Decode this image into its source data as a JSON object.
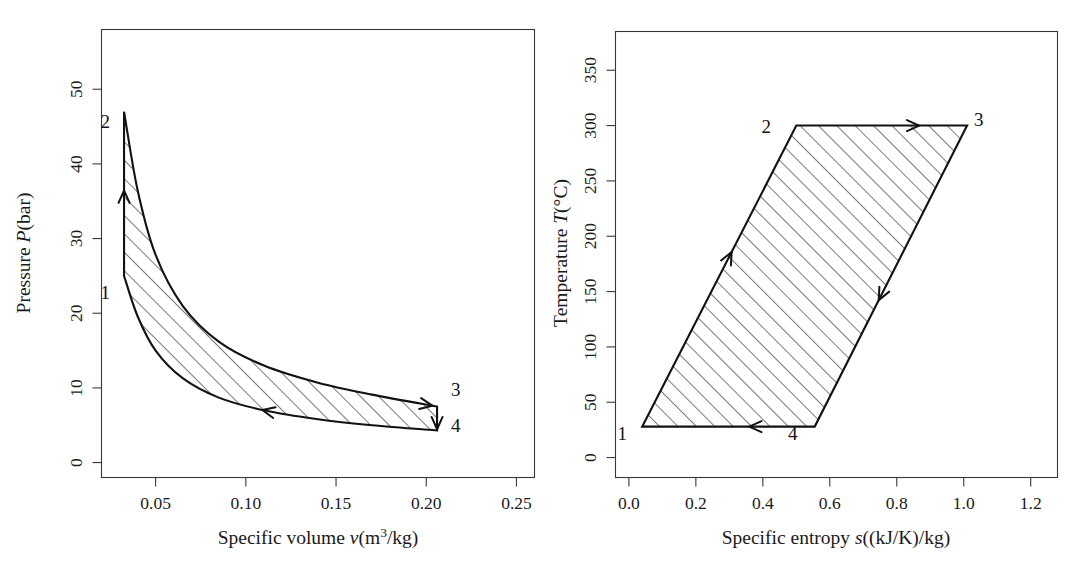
{
  "figure": {
    "panels": [
      {
        "id": "pv-diagram",
        "xlabel_prefix": "Specific volume ",
        "xlabel_symbol": "v",
        "xlabel_units": "(m",
        "xlabel_exp": "3",
        "xlabel_units_tail": "/kg)",
        "ylabel_prefix": "Pressure ",
        "ylabel_symbol": "P",
        "ylabel_units": "(bar)",
        "xticklabels": [
          "0.05",
          "0.10",
          "0.15",
          "0.20",
          "0.25"
        ],
        "yticklabels": [
          "0",
          "10",
          "20",
          "30",
          "40",
          "50"
        ],
        "statelabels": [
          "1",
          "2",
          "3",
          "4"
        ]
      },
      {
        "id": "ts-diagram",
        "xlabel_prefix": "Specific entropy ",
        "xlabel_symbol": "s",
        "xlabel_units": "((kJ/K)/kg)",
        "ylabel_prefix": "Temperature ",
        "ylabel_symbol": "T",
        "ylabel_units": "(°C)",
        "xticklabels": [
          "0.0",
          "0.2",
          "0.4",
          "0.6",
          "0.8",
          "1.0",
          "1.2"
        ],
        "yticklabels": [
          "0",
          "50",
          "100",
          "150",
          "200",
          "250",
          "300",
          "350"
        ],
        "statelabels": [
          "1",
          "2",
          "3",
          "4"
        ]
      }
    ]
  },
  "chart_data": [
    {
      "type": "line",
      "id": "pv-diagram",
      "title": "",
      "xlabel": "Specific volume v(m3/kg)",
      "ylabel": "Pressure P(bar)",
      "xlim": [
        0.02,
        0.26
      ],
      "ylim": [
        -2,
        58
      ],
      "xticks": [
        0.05,
        0.1,
        0.15,
        0.2,
        0.25
      ],
      "yticks": [
        0,
        10,
        20,
        30,
        40,
        50
      ],
      "grid": false,
      "legend": false,
      "annotations": [
        {
          "label": "1",
          "x": 0.0325,
          "y": 25.0
        },
        {
          "label": "2",
          "x": 0.0325,
          "y": 47.0
        },
        {
          "label": "3",
          "x": 0.206,
          "y": 7.5
        },
        {
          "label": "4",
          "x": 0.206,
          "y": 4.3
        }
      ],
      "series": [
        {
          "name": "1-2 isentropic compression",
          "direction": "upward",
          "points": [
            [
              0.0325,
              25.0
            ],
            [
              0.0325,
              47.0
            ]
          ]
        },
        {
          "name": "2-3 expansion (upper curve)",
          "direction": "rightward",
          "points": [
            [
              0.0325,
              47.0
            ],
            [
              0.04,
              36.5
            ],
            [
              0.05,
              27.8
            ],
            [
              0.065,
              21.0
            ],
            [
              0.085,
              16.2
            ],
            [
              0.11,
              13.0
            ],
            [
              0.14,
              10.7
            ],
            [
              0.17,
              9.1
            ],
            [
              0.206,
              7.5
            ]
          ]
        },
        {
          "name": "3-4 heat rejection",
          "direction": "downward",
          "points": [
            [
              0.206,
              7.5
            ],
            [
              0.206,
              4.3
            ]
          ]
        },
        {
          "name": "4-1 compression (lower curve)",
          "direction": "leftward",
          "points": [
            [
              0.206,
              4.3
            ],
            [
              0.17,
              5.0
            ],
            [
              0.14,
              5.8
            ],
            [
              0.11,
              7.0
            ],
            [
              0.085,
              8.7
            ],
            [
              0.065,
              11.3
            ],
            [
              0.05,
              15.0
            ],
            [
              0.04,
              19.6
            ],
            [
              0.0325,
              25.0
            ]
          ]
        }
      ],
      "hatched_region": true
    },
    {
      "type": "line",
      "id": "ts-diagram",
      "title": "",
      "xlabel": "Specific entropy s((kJ/K)/kg)",
      "ylabel": "Temperature T(°C)",
      "xlim": [
        -0.04,
        1.28
      ],
      "ylim": [
        -18,
        385
      ],
      "xticks": [
        0.0,
        0.2,
        0.4,
        0.6,
        0.8,
        1.0,
        1.2
      ],
      "yticks": [
        0,
        50,
        100,
        150,
        200,
        250,
        300,
        350
      ],
      "grid": false,
      "legend": false,
      "annotations": [
        {
          "label": "1",
          "x": 0.04,
          "y": 28
        },
        {
          "label": "2",
          "x": 0.5,
          "y": 300
        },
        {
          "label": "3",
          "x": 1.01,
          "y": 300
        },
        {
          "label": "4",
          "x": 0.555,
          "y": 28
        }
      ],
      "series": [
        {
          "name": "1-2 heating",
          "direction": "upward",
          "points": [
            [
              0.04,
              28
            ],
            [
              0.5,
              300
            ]
          ]
        },
        {
          "name": "2-3 isothermal expansion",
          "direction": "rightward",
          "points": [
            [
              0.5,
              300
            ],
            [
              1.01,
              300
            ]
          ]
        },
        {
          "name": "3-4 cooling",
          "direction": "downward",
          "points": [
            [
              1.01,
              300
            ],
            [
              0.555,
              28
            ]
          ]
        },
        {
          "name": "4-1 isothermal compression",
          "direction": "leftward",
          "points": [
            [
              0.555,
              28
            ],
            [
              0.04,
              28
            ]
          ]
        }
      ],
      "hatched_region": true
    }
  ]
}
